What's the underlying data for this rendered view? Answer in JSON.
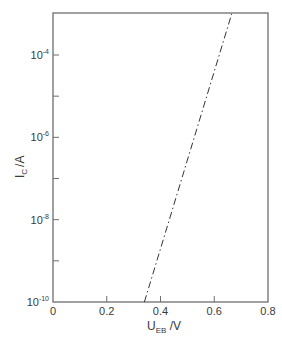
{
  "chart_data": {
    "type": "line",
    "title": "",
    "xlabel": "U_EB / V",
    "xlabel_main": "U",
    "xlabel_sub": "EB",
    "xlabel_unit": " /V",
    "ylabel": "I_C / A",
    "ylabel_main": "I",
    "ylabel_sub": "C",
    "ylabel_unit": "/A",
    "xlim": [
      0,
      0.8
    ],
    "ylim_log10": [
      -10,
      -3
    ],
    "yscale": "log",
    "grid": false,
    "legend": null,
    "x_ticks": [
      {
        "value": 0,
        "label": "0"
      },
      {
        "value": 0.2,
        "label": "0.2"
      },
      {
        "value": 0.4,
        "label": "0.4"
      },
      {
        "value": 0.6,
        "label": "0.6"
      },
      {
        "value": 0.8,
        "label": "0.8"
      }
    ],
    "y_ticks_labeled": [
      {
        "exp": -4,
        "base": "10",
        "sup": "-4"
      },
      {
        "exp": -6,
        "base": "10",
        "sup": "-6"
      },
      {
        "exp": -8,
        "base": "10",
        "sup": "-8"
      },
      {
        "exp": -10,
        "base": "10",
        "sup": "-10"
      }
    ],
    "y_ticks_minor_exp": [
      -5,
      -7,
      -9
    ],
    "series": [
      {
        "name": "I_C vs U_EB",
        "style": "dash-dot",
        "x": [
          0.34,
          0.665
        ],
        "y_log10": [
          -10,
          -3
        ]
      }
    ]
  },
  "colors": {
    "axis": "#6e6e6e",
    "line": "#333333",
    "text": "#3a3a3a"
  }
}
